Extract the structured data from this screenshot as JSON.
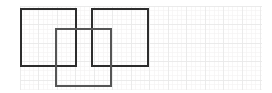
{
  "canvas": {
    "width": 272,
    "height": 93,
    "background": "#ffffff",
    "description": "Three overlapping squares drawn on a faint graph-paper grid"
  },
  "grid": {
    "major_color": "#e9e9e9",
    "minor_color": "#f4f2f2",
    "major_spacing": 18.5,
    "minor_spacing": 4.625,
    "x_start": 20,
    "x_end": 262,
    "y_start": 6,
    "y_end": 90,
    "major_x_lines": [
      20,
      38.5,
      57,
      75.5,
      94,
      112.5,
      131,
      149.5,
      168,
      186.5,
      205,
      223.5,
      242,
      260.5
    ],
    "major_y_lines": [
      6,
      24.5,
      43,
      61.5,
      80
    ],
    "visible": true
  },
  "shapes": [
    {
      "name": "square-left",
      "type": "rect",
      "x": 21,
      "y": 9,
      "width": 55,
      "height": 57,
      "stroke": "#2d2d2d",
      "stroke_width": 1.4,
      "fill": "none"
    },
    {
      "name": "square-right",
      "type": "rect",
      "x": 92,
      "y": 9,
      "width": 56,
      "height": 57,
      "stroke": "#2d2d2d",
      "stroke_width": 1.4,
      "fill": "none"
    },
    {
      "name": "square-center-lower",
      "type": "rect",
      "x": 56,
      "y": 29,
      "width": 55,
      "height": 57,
      "stroke": "#555555",
      "stroke_width": 1.4,
      "fill": "none"
    }
  ]
}
